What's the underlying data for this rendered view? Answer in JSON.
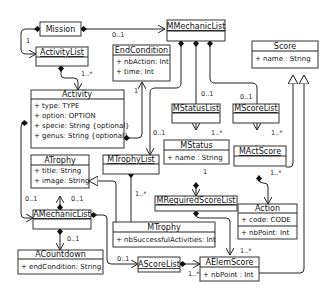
{
  "diagram": {
    "type": "UML class diagram",
    "classes": [
      {
        "id": "mission",
        "name": "Mission",
        "underlined": false,
        "attributes": []
      },
      {
        "id": "activitylist",
        "name": "ActivityList",
        "underlined": true,
        "attributes": []
      },
      {
        "id": "activity",
        "name": "Activity",
        "underlined": false,
        "attributes": [
          "+ type: TYPE",
          "+ option: OPTION",
          "+ specie: String {optional}",
          "+ genus: String {optional}"
        ]
      },
      {
        "id": "endcondition",
        "name": "EndCondition",
        "underlined": false,
        "attributes": [
          "+ nbAction: Int",
          "+ time: Int"
        ]
      },
      {
        "id": "mmechaniclist",
        "name": "MMechanicList",
        "underlined": true,
        "attributes": []
      },
      {
        "id": "score",
        "name": "Score",
        "underlined": false,
        "attributes": [
          "+ name : String"
        ]
      },
      {
        "id": "mstatuslist",
        "name": "MStatusList",
        "underlined": true,
        "attributes": []
      },
      {
        "id": "mscorelist",
        "name": "MScoreList",
        "underlined": true,
        "attributes": []
      },
      {
        "id": "mstatus",
        "name": "MStatus",
        "underlined": false,
        "attributes": [
          "+ name : String"
        ]
      },
      {
        "id": "mactscore",
        "name": "MActScore",
        "underlined": true,
        "attributes": []
      },
      {
        "id": "atrophy",
        "name": "ATrophy",
        "underlined": false,
        "attributes": [
          "+ title: String",
          "+ image: String"
        ]
      },
      {
        "id": "mtrophylist",
        "name": "MTrophyList",
        "underlined": true,
        "attributes": []
      },
      {
        "id": "mrequiredscorelist",
        "name": "MRequiredScoreList",
        "underlined": true,
        "attributes": []
      },
      {
        "id": "action",
        "name": "Action",
        "underlined": false,
        "attributes": [
          "+ code: CODE",
          "+ nbPoint: Int"
        ]
      },
      {
        "id": "amechaniclist",
        "name": "AMechanicList",
        "underlined": true,
        "attributes": []
      },
      {
        "id": "mtrophy",
        "name": "MTrophy",
        "underlined": false,
        "attributes": [
          "+ nbSuccessfulActivities: Int"
        ]
      },
      {
        "id": "acountdown",
        "name": "ACountdown",
        "underlined": false,
        "attributes": [
          "+ endCondition: String"
        ]
      },
      {
        "id": "ascorelist",
        "name": "AScoreList",
        "underlined": true,
        "attributes": []
      },
      {
        "id": "aelemscore",
        "name": "AElemScore",
        "underlined": false,
        "attributes": [
          "+ nbPoint : Int"
        ]
      }
    ],
    "multiplicities": {
      "mission_mmechaniclist": "0..1",
      "mission_activitylist": "1",
      "activitylist_activity": "1..*",
      "endcondition": "1",
      "mmechaniclist_mstatuslist": "0..1",
      "mmechaniclist_mscorelist": "0..1",
      "mmechaniclist_mtrophylist": "0..1",
      "mstatuslist_mstatus": "1..*",
      "mscorelist_mactscore": "1..*",
      "mstatus_mrequiredscorelist": "1",
      "mactscore_action": "1..*",
      "mtrophylist_mtrophy": "1..*",
      "amechaniclist_atrophy": "0..1",
      "activity_amechaniclist": "0..1",
      "amechaniclist_acountdown": "0..1",
      "amechaniclist_ascorelist": "0..1",
      "mrequiredscorelist_aelemscore": "1..*",
      "ascorelist_aelemscore": "1..*"
    }
  }
}
